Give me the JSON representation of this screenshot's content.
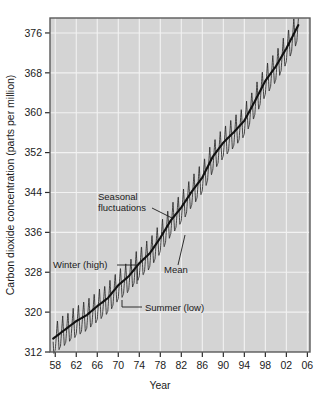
{
  "chart_data": {
    "type": "line",
    "title": "",
    "xlabel": "Year",
    "ylabel": "Carbon dioxide concentration (parts per million)",
    "xlim": [
      1957,
      2006.5
    ],
    "ylim": [
      312,
      379
    ],
    "x_tick_labels": [
      "58",
      "62",
      "66",
      "70",
      "74",
      "78",
      "82",
      "86",
      "90",
      "94",
      "98",
      "02",
      "06"
    ],
    "x_tick_values": [
      1958,
      1962,
      1966,
      1970,
      1974,
      1978,
      1982,
      1986,
      1990,
      1994,
      1998,
      2002,
      2006
    ],
    "y_tick_labels": [
      "376",
      "368",
      "360",
      "352",
      "344",
      "336",
      "328",
      "320",
      "312"
    ],
    "y_tick_values": [
      376,
      368,
      360,
      352,
      344,
      336,
      328,
      320,
      312
    ],
    "grid": true,
    "legend_position": "none",
    "series": [
      {
        "name": "Mean",
        "description": "Smoothed annual mean CO2 concentration (Keeling curve trend)",
        "x": [
          1958,
          1960,
          1962,
          1964,
          1966,
          1968,
          1970,
          1972,
          1974,
          1976,
          1978,
          1980,
          1982,
          1984,
          1986,
          1988,
          1990,
          1992,
          1994,
          1996,
          1998,
          2000,
          2002,
          2004
        ],
        "values": [
          315.0,
          316.6,
          318.2,
          319.4,
          321.2,
          322.8,
          325.4,
          327.2,
          329.8,
          331.8,
          334.9,
          338.4,
          341.0,
          344.2,
          347.0,
          351.2,
          354.0,
          356.1,
          358.4,
          362.3,
          366.4,
          369.3,
          372.9,
          377.0
        ]
      },
      {
        "name": "Seasonal fluctuations",
        "description": "Monthly CO2 with annual sawtooth cycle, winter highs and summer lows about 3 ppm above and below the mean",
        "amplitude_ppm": 3.1,
        "period_years": 1
      }
    ],
    "annotations": [
      {
        "name": "seasonal-fluctuations",
        "text": "Seasonal fluctuations",
        "x": 1974.5,
        "y": 341.5
      },
      {
        "name": "mean",
        "text": "Mean",
        "x": 1983.0,
        "y": 331.0
      },
      {
        "name": "winter-high",
        "text": "Winter (high)",
        "x": 1962.5,
        "y": 329.5
      },
      {
        "name": "summer-low",
        "text": "Summer (low)",
        "x": 1973.5,
        "y": 322.0
      }
    ],
    "colors": {
      "plot_background": "#d4d4d4",
      "gridline": "#f2f2f2",
      "curve": "#2a2a2a",
      "mean_curve": "#111111",
      "frame": "#5a5a5a",
      "page_background": "#ffffff",
      "text": "#1b1b1b"
    }
  }
}
